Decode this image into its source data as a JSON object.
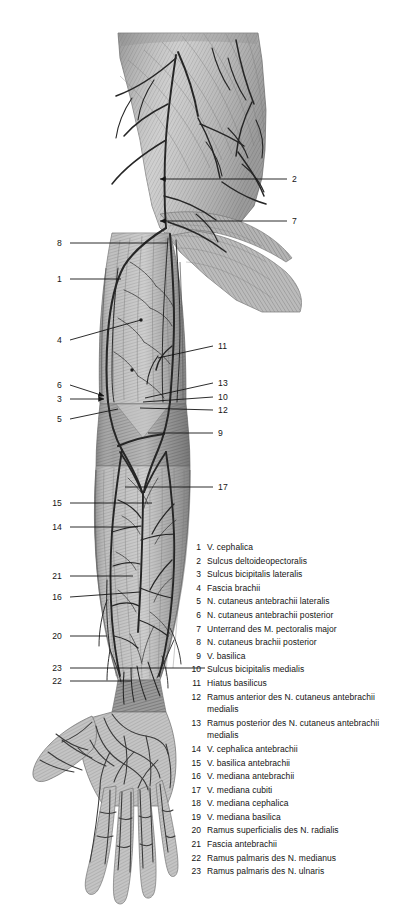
{
  "plate": {
    "title": "Superficial veins and cutaneous nerves of the right upper limb, anterior view",
    "view": "anterior",
    "style": "grayscale anatomical engraving",
    "background_color": "#ffffff",
    "ink_color": "#2b2b2b"
  },
  "leader_labels": [
    {
      "id": "2",
      "side": "right",
      "x": 292,
      "y": 179,
      "tip_x": 160,
      "tip_y": 179,
      "arrow": true
    },
    {
      "id": "7",
      "side": "right",
      "x": 292,
      "y": 221,
      "tip_x": 160,
      "tip_y": 221,
      "arrow": true
    },
    {
      "id": "8",
      "side": "left",
      "x": 62,
      "y": 243,
      "tip_x": 168,
      "tip_y": 243,
      "arrow": false
    },
    {
      "id": "1",
      "side": "left",
      "x": 62,
      "y": 279,
      "tip_x": 121,
      "tip_y": 279,
      "arrow": false
    },
    {
      "id": "4",
      "side": "left",
      "x": 62,
      "y": 340,
      "tip_x": 141,
      "tip_y": 320,
      "arrow": false
    },
    {
      "id": "11",
      "side": "right",
      "x": 218,
      "y": 346,
      "tip_x": 158,
      "tip_y": 358,
      "arrow": false
    },
    {
      "id": "6",
      "side": "left",
      "x": 62,
      "y": 385,
      "tip_x": 104,
      "tip_y": 396,
      "arrow": true
    },
    {
      "id": "13",
      "side": "right",
      "x": 218,
      "y": 383,
      "tip_x": 145,
      "tip_y": 398,
      "arrow": false
    },
    {
      "id": "3",
      "side": "left",
      "x": 62,
      "y": 399,
      "tip_x": 104,
      "tip_y": 399,
      "arrow": true
    },
    {
      "id": "10",
      "side": "right",
      "x": 218,
      "y": 397,
      "tip_x": 143,
      "tip_y": 402,
      "arrow": false
    },
    {
      "id": "12",
      "side": "right",
      "x": 218,
      "y": 410,
      "tip_x": 140,
      "tip_y": 408,
      "arrow": false
    },
    {
      "id": "5",
      "side": "left",
      "x": 62,
      "y": 419,
      "tip_x": 118,
      "tip_y": 409,
      "arrow": false
    },
    {
      "id": "9",
      "side": "right",
      "x": 218,
      "y": 433,
      "tip_x": 148,
      "tip_y": 433,
      "arrow": false
    },
    {
      "id": "17",
      "side": "right",
      "x": 218,
      "y": 487,
      "tip_x": 125,
      "tip_y": 487,
      "arrow": false
    },
    {
      "id": "15",
      "side": "left",
      "x": 62,
      "y": 503,
      "tip_x": 152,
      "tip_y": 503,
      "arrow": false
    },
    {
      "id": "14",
      "side": "left",
      "x": 62,
      "y": 527,
      "tip_x": 138,
      "tip_y": 527,
      "arrow": false
    },
    {
      "id": "21",
      "side": "left",
      "x": 62,
      "y": 576,
      "tip_x": 133,
      "tip_y": 576,
      "arrow": false
    },
    {
      "id": "16",
      "side": "left",
      "x": 62,
      "y": 597,
      "tip_x": 140,
      "tip_y": 592,
      "arrow": false
    },
    {
      "id": "20",
      "side": "left",
      "x": 62,
      "y": 636,
      "tip_x": 107,
      "tip_y": 636,
      "arrow": false
    },
    {
      "id": "23",
      "side": "left",
      "x": 62,
      "y": 668,
      "tip_x": 205,
      "tip_y": 668,
      "arrow": false
    },
    {
      "id": "22",
      "side": "left",
      "x": 62,
      "y": 681,
      "tip_x": 131,
      "tip_y": 681,
      "arrow": false
    }
  ],
  "legend": {
    "entries": [
      {
        "num": "1",
        "text": "V. cephalica"
      },
      {
        "num": "2",
        "text": "Sulcus deltoideopectoralis"
      },
      {
        "num": "3",
        "text": "Sulcus bicipitalis lateralis"
      },
      {
        "num": "4",
        "text": "Fascia brachii"
      },
      {
        "num": "5",
        "text": "N. cutaneus antebrachii lateralis"
      },
      {
        "num": "6",
        "text": "N. cutaneus antebrachii posterior"
      },
      {
        "num": "7",
        "text": "Unterrand des M. pectoralis major"
      },
      {
        "num": "8",
        "text": "N. cutaneus brachii posterior"
      },
      {
        "num": "9",
        "text": "V. basilica"
      },
      {
        "num": "10",
        "text": "Sulcus bicipitalis medialis"
      },
      {
        "num": "11",
        "text": "Hiatus basilicus"
      },
      {
        "num": "12",
        "text": "Ramus anterior des N. cutaneus antebrachii medialis"
      },
      {
        "num": "13",
        "text": "Ramus posterior des N. cutaneus antebrachii medialis"
      },
      {
        "num": "14",
        "text": "V. cephalica antebrachii"
      },
      {
        "num": "15",
        "text": "V. basilica antebrachii"
      },
      {
        "num": "16",
        "text": "V. mediana antebrachii"
      },
      {
        "num": "17",
        "text": "V. mediana cubiti"
      },
      {
        "num": "18",
        "text": "V. mediana cephalica"
      },
      {
        "num": "19",
        "text": "V. mediana basilica"
      },
      {
        "num": "20",
        "text": "Ramus superficialis des N. radialis"
      },
      {
        "num": "21",
        "text": "Fascia antebrachii"
      },
      {
        "num": "22",
        "text": "Ramus palmaris des N. medianus"
      },
      {
        "num": "23",
        "text": "Ramus palmaris des N. ulnaris"
      }
    ]
  }
}
